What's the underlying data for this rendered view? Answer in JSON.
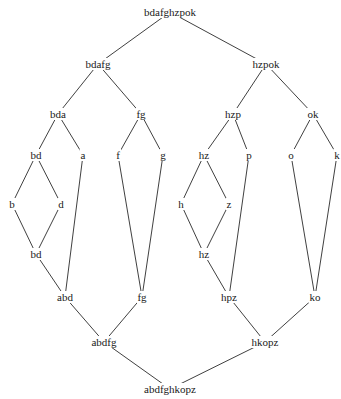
{
  "diagram": {
    "type": "lattice",
    "nodes": [
      {
        "id": "n0",
        "label": "bdafghzpok",
        "x": 170,
        "y": 12
      },
      {
        "id": "n1",
        "label": "bdafg",
        "x": 98,
        "y": 64
      },
      {
        "id": "n2",
        "label": "hzpok",
        "x": 266,
        "y": 64
      },
      {
        "id": "n3",
        "label": "bda",
        "x": 58,
        "y": 114
      },
      {
        "id": "n4",
        "label": "fg",
        "x": 141,
        "y": 114
      },
      {
        "id": "n5",
        "label": "hzp",
        "x": 233,
        "y": 114
      },
      {
        "id": "n6",
        "label": "ok",
        "x": 313,
        "y": 114
      },
      {
        "id": "n7",
        "label": "bd",
        "x": 36,
        "y": 155
      },
      {
        "id": "n8",
        "label": "a",
        "x": 83,
        "y": 155
      },
      {
        "id": "n9",
        "label": "f",
        "x": 118,
        "y": 155
      },
      {
        "id": "n10",
        "label": "g",
        "x": 163,
        "y": 155
      },
      {
        "id": "n11",
        "label": "hz",
        "x": 204,
        "y": 155
      },
      {
        "id": "n12",
        "label": "p",
        "x": 249,
        "y": 155
      },
      {
        "id": "n13",
        "label": "o",
        "x": 291,
        "y": 155
      },
      {
        "id": "n14",
        "label": "k",
        "x": 337,
        "y": 155
      },
      {
        "id": "n15",
        "label": "b",
        "x": 12,
        "y": 204
      },
      {
        "id": "n16",
        "label": "d",
        "x": 61,
        "y": 204
      },
      {
        "id": "n17",
        "label": "h",
        "x": 181,
        "y": 204
      },
      {
        "id": "n18",
        "label": "z",
        "x": 229,
        "y": 204
      },
      {
        "id": "n19",
        "label": "bd",
        "x": 36,
        "y": 254
      },
      {
        "id": "n20",
        "label": "hz",
        "x": 204,
        "y": 254
      },
      {
        "id": "n21",
        "label": "abd",
        "x": 65,
        "y": 297
      },
      {
        "id": "n22",
        "label": "fg",
        "x": 142,
        "y": 297
      },
      {
        "id": "n23",
        "label": "hpz",
        "x": 229,
        "y": 297
      },
      {
        "id": "n24",
        "label": "ko",
        "x": 315,
        "y": 297
      },
      {
        "id": "n25",
        "label": "abdfg",
        "x": 104,
        "y": 342
      },
      {
        "id": "n26",
        "label": "hkopz",
        "x": 265,
        "y": 342
      },
      {
        "id": "n27",
        "label": "abdfghkopz",
        "x": 170,
        "y": 389
      }
    ],
    "edges": [
      [
        "n0",
        "n1"
      ],
      [
        "n0",
        "n2"
      ],
      [
        "n1",
        "n3"
      ],
      [
        "n1",
        "n4"
      ],
      [
        "n2",
        "n5"
      ],
      [
        "n2",
        "n6"
      ],
      [
        "n3",
        "n7"
      ],
      [
        "n3",
        "n8"
      ],
      [
        "n4",
        "n9"
      ],
      [
        "n4",
        "n10"
      ],
      [
        "n5",
        "n11"
      ],
      [
        "n5",
        "n12"
      ],
      [
        "n6",
        "n13"
      ],
      [
        "n6",
        "n14"
      ],
      [
        "n7",
        "n15"
      ],
      [
        "n7",
        "n16"
      ],
      [
        "n11",
        "n17"
      ],
      [
        "n11",
        "n18"
      ],
      [
        "n15",
        "n19"
      ],
      [
        "n16",
        "n19"
      ],
      [
        "n17",
        "n20"
      ],
      [
        "n18",
        "n20"
      ],
      [
        "n19",
        "n21"
      ],
      [
        "n8",
        "n21"
      ],
      [
        "n9",
        "n22"
      ],
      [
        "n10",
        "n22"
      ],
      [
        "n20",
        "n23"
      ],
      [
        "n12",
        "n23"
      ],
      [
        "n13",
        "n24"
      ],
      [
        "n14",
        "n24"
      ],
      [
        "n21",
        "n25"
      ],
      [
        "n22",
        "n25"
      ],
      [
        "n23",
        "n26"
      ],
      [
        "n24",
        "n26"
      ],
      [
        "n25",
        "n27"
      ],
      [
        "n26",
        "n27"
      ]
    ]
  }
}
